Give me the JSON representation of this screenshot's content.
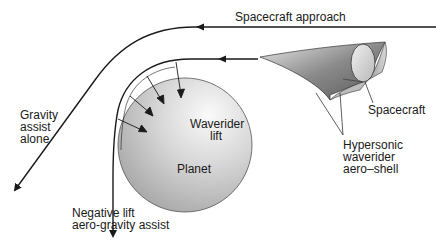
{
  "diagram": {
    "labels": {
      "spacecraft_approach": "Spacecraft approach",
      "gravity_assist_line1": "Gravity",
      "gravity_assist_line2": "assist",
      "gravity_assist_line3": "alone",
      "waverider_lift_line1": "Waverider",
      "waverider_lift_line2": "lift",
      "planet": "Planet",
      "spacecraft": "Spacecraft",
      "aeroshell_line1": "Hypersonic",
      "aeroshell_line2": "waverider",
      "aeroshell_line3": "aero–shell",
      "negative_lift_line1": "Negative lift",
      "negative_lift_line2": "aero-gravity assist"
    },
    "colors": {
      "line": "#1a1a1a",
      "planet_light": "#f2f2f2",
      "planet_dark": "#a8a8a8",
      "shell_light": "#e6e6e6",
      "shell_dark": "#6e6e6e",
      "background": "#ffffff"
    },
    "elements": {
      "trajectories": [
        "gravity-assist-trajectory",
        "aero-gravity-assist-trajectory"
      ],
      "lift_vectors_count": 4
    }
  }
}
